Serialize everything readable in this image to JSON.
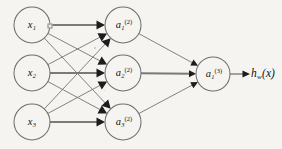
{
  "figure": {
    "type": "neural-network-diagram",
    "width": 282,
    "height": 149,
    "background_color": "#f6f4f1",
    "stroke_color": "#6d6d6d",
    "label_color": "#14120f",
    "arrowhead_color": "#1c1c1c"
  },
  "layers": {
    "input": {
      "name": "input-layer",
      "nodes": [
        {
          "id": "x1",
          "base": "x",
          "sub": "1",
          "sup": "",
          "cx": 32,
          "cy": 25,
          "r": 18
        },
        {
          "id": "x2",
          "base": "x",
          "sub": "2",
          "sup": "",
          "cx": 32,
          "cy": 73,
          "r": 18
        },
        {
          "id": "x3",
          "base": "x",
          "sub": "3",
          "sup": "",
          "cx": 32,
          "cy": 122,
          "r": 18
        }
      ]
    },
    "hidden": {
      "name": "hidden-layer",
      "nodes": [
        {
          "id": "a1_2",
          "base": "a",
          "sub": "1",
          "sup": "(2)",
          "cx": 123,
          "cy": 25,
          "r": 18
        },
        {
          "id": "a2_2",
          "base": "a",
          "sub": "2",
          "sup": "(2)",
          "cx": 123,
          "cy": 73,
          "r": 18
        },
        {
          "id": "a3_2",
          "base": "a",
          "sub": "3",
          "sup": "(2)",
          "cx": 123,
          "cy": 122,
          "r": 18
        }
      ]
    },
    "output": {
      "name": "output-layer",
      "nodes": [
        {
          "id": "a1_3",
          "base": "a",
          "sub": "1",
          "sup": "(3)",
          "cx": 213,
          "cy": 74,
          "r": 17
        }
      ]
    }
  },
  "output_label": {
    "base": "h",
    "sub": "w",
    "arg": "(x)",
    "x": 263,
    "y": 74
  },
  "connections": {
    "input_to_hidden": [
      {
        "from": "x1",
        "to": "a1_2",
        "emphasis": "thick"
      },
      {
        "from": "x1",
        "to": "a2_2",
        "emphasis": "thin"
      },
      {
        "from": "x1",
        "to": "a3_2",
        "emphasis": "thin"
      },
      {
        "from": "x2",
        "to": "a1_2",
        "emphasis": "thin"
      },
      {
        "from": "x2",
        "to": "a2_2",
        "emphasis": "thick"
      },
      {
        "from": "x2",
        "to": "a3_2",
        "emphasis": "thin"
      },
      {
        "from": "x3",
        "to": "a1_2",
        "emphasis": "thin"
      },
      {
        "from": "x3",
        "to": "a2_2",
        "emphasis": "thin"
      },
      {
        "from": "x3",
        "to": "a3_2",
        "emphasis": "thick"
      }
    ],
    "hidden_to_output": [
      {
        "from": "a1_2",
        "to": "a1_3",
        "emphasis": "thin"
      },
      {
        "from": "a2_2",
        "to": "a1_3",
        "emphasis": "thick"
      },
      {
        "from": "a3_2",
        "to": "a1_3",
        "emphasis": "thin"
      }
    ],
    "output_to_result": [
      {
        "from": "a1_3",
        "to": "h_w_x",
        "emphasis": "thin"
      }
    ]
  },
  "marker": {
    "name": "weight-marker",
    "x": 50,
    "y": 26
  }
}
